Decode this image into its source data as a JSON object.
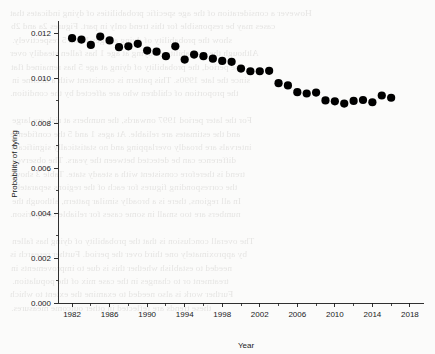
{
  "figure": {
    "background_color": "#fbfbfa",
    "marker_color": "#000000",
    "axis_color": "#1a1a1a"
  },
  "chart_data": {
    "type": "scatter",
    "title": "",
    "xlabel": "Year",
    "ylabel": "Probability of dying",
    "xlim": [
      1980.5,
      2019.5
    ],
    "ylim": [
      0.0,
      0.0125
    ],
    "grid": false,
    "legend": null,
    "xticks": [
      1982,
      1986,
      1990,
      1994,
      1998,
      2002,
      2006,
      2010,
      2014,
      2018
    ],
    "xtick_labels": [
      "1982",
      "1986",
      "1990",
      "1994",
      "1998",
      "2002",
      "2006",
      "2010",
      "2014",
      "2018"
    ],
    "xminor_ticks": [
      1984,
      1988,
      1992,
      1996,
      2000,
      2004,
      2008,
      2012,
      2016
    ],
    "yticks": [
      0.0,
      0.002,
      0.004,
      0.006,
      0.008,
      0.01,
      0.012
    ],
    "ytick_labels": [
      "0.000",
      "0.002",
      "0.004",
      "0.006",
      "0.008",
      "0.010",
      "0.012"
    ],
    "yminor_ticks": [
      0.001,
      0.003,
      0.005,
      0.007,
      0.009,
      0.011
    ],
    "marker": "circle",
    "marker_size": 4.1,
    "x": [
      1982,
      1983,
      1984,
      1985,
      1986,
      1987,
      1988,
      1989,
      1990,
      1991,
      1992,
      1993,
      1994,
      1995,
      1996,
      1997,
      1998,
      1999,
      2000,
      2001,
      2002,
      2003,
      2004,
      2005,
      2006,
      2007,
      2008,
      2009,
      2010,
      2011,
      2012,
      2013,
      2014,
      2015,
      2016
    ],
    "y": [
      0.01178,
      0.01172,
      0.01148,
      0.01185,
      0.01168,
      0.01138,
      0.01142,
      0.01153,
      0.01123,
      0.01118,
      0.01098,
      0.01142,
      0.01083,
      0.01105,
      0.01098,
      0.01087,
      0.01077,
      0.01073,
      0.01043,
      0.01031,
      0.01031,
      0.01033,
      0.00978,
      0.00968,
      0.00938,
      0.00932,
      0.00936,
      0.00901,
      0.00897,
      0.00887,
      0.00899,
      0.00903,
      0.00893,
      0.00923,
      0.00913
    ],
    "series_name": "Probability of dying"
  },
  "ghost_text": {
    "note": "faint bleed-through text visible behind the plot",
    "lines": [
      "However a consideration of the age specific probabilities of dying indicates that",
      "cases may be responsible for this trend only in part. Figures 2a and 2b",
      "show the probability of dying at ages 1 and 5 respectively.",
      "Although the probability of dying at age 1 has fallen steadily over",
      "the period, the probability of dying at age 5 has remained flat",
      "since the late 1990s. This pattern is consistent with a decline in",
      "the proportion of children who are affected by the condition.",
      "",
      "For the later period 1997 onwards, the numbers at risk are large",
      "and the estimates are reliable. At ages 1 and 5 the confidence",
      "intervals are broadly overlapping and no statistically significant",
      "difference can be detected between the years. The observed",
      "trend is therefore consistent with a steady state. Table 3 shows",
      "the corresponding figures for each of the regions separately.",
      "In all regions, there is a broadly similar pattern, although the",
      "numbers are too small in some cases for reliable comparison.",
      "",
      "The overall conclusion is that the probability of dying has fallen",
      "by approximately one third over the period. Further research is",
      "needed to establish whether this is due to improvements in",
      "treatment or to changes in the case mix of the population.",
      "Further work is also needed to examine the extent to which",
      "these trends are reflected in other outcome measures."
    ]
  }
}
